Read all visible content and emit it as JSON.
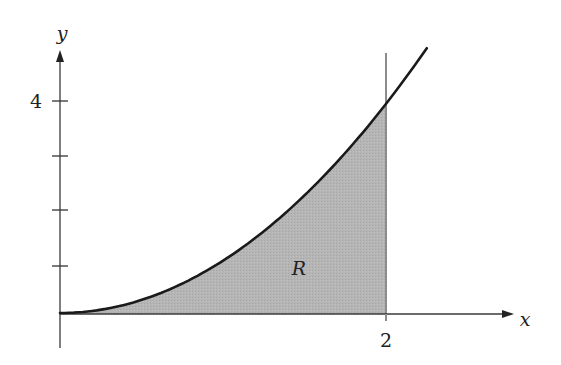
{
  "figure": {
    "type": "region-under-curve"
  },
  "axes": {
    "x_label": "x",
    "y_label": "y",
    "x_tick_labels": [
      "2"
    ],
    "y_tick_labels": [
      "4"
    ],
    "y_ticks": [
      1,
      2,
      3,
      4
    ],
    "x_ticks": [
      2
    ]
  },
  "region": {
    "label": "R",
    "x_from": 0,
    "x_to": 2,
    "fill_color": "#b3b3b3"
  },
  "curve": {
    "approx_function": "y = x^2",
    "x_range": [
      0,
      2.25
    ],
    "stroke_color": "#1a1a1a"
  },
  "boundary_line": {
    "x": 2,
    "stroke_color": "#8c8c8c"
  },
  "chart_data": {
    "type": "area",
    "title": "",
    "xlabel": "x",
    "ylabel": "y",
    "x": [
      0,
      0.25,
      0.5,
      0.75,
      1.0,
      1.25,
      1.5,
      1.75,
      2.0,
      2.25
    ],
    "series": [
      {
        "name": "curve",
        "values": [
          0,
          0.06,
          0.25,
          0.56,
          1.0,
          1.56,
          2.25,
          3.06,
          4.0,
          5.06
        ]
      }
    ],
    "shaded_region": {
      "label": "R",
      "x_from": 0,
      "x_to": 2
    },
    "xlim": [
      0,
      2.8
    ],
    "ylim": [
      -0.6,
      5.0
    ],
    "x_tick_labels": [
      "2"
    ],
    "y_tick_labels": [
      "4"
    ],
    "grid": false,
    "legend": "none"
  }
}
